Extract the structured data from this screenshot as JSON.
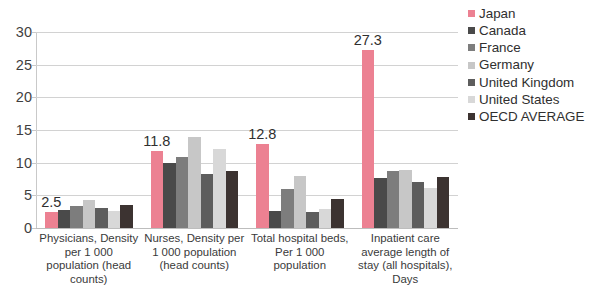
{
  "chart_data": {
    "type": "bar",
    "title": "",
    "subtitle": "",
    "xlabel": "",
    "ylabel": "",
    "ylim": [
      0,
      30
    ],
    "ytick_step": 5,
    "ytick_labels": [
      "30",
      "25",
      "20",
      "15",
      "10",
      "5",
      "0"
    ],
    "ytick_values": [
      30,
      25,
      20,
      15,
      10,
      5,
      0
    ],
    "grid": true,
    "legend_position": "right",
    "categories": [
      "Physicians, Density per 1 000 population (head counts)",
      "Nurses, Density per 1 000 population (head counts)",
      "Total hospital beds, Per 1 000 population",
      "Inpatient care average length of stay (all hospitals), Days"
    ],
    "category_lines": [
      [
        "Physicians, Density",
        "per 1 000",
        "population (head",
        "counts)"
      ],
      [
        "Nurses, Density per",
        "1 000 population",
        "(head counts)"
      ],
      [
        "Total hospital beds,",
        "Per 1 000",
        "population"
      ],
      [
        "Inpatient care",
        "average length of",
        "stay (all hospitals),",
        "Days"
      ]
    ],
    "series": [
      {
        "name": "Japan",
        "color": "#ec8192",
        "values": [
          2.5,
          11.8,
          12.8,
          27.3
        ]
      },
      {
        "name": "Canada",
        "color": "#4a4a4a",
        "values": [
          2.8,
          10.0,
          2.6,
          7.7
        ]
      },
      {
        "name": "France",
        "color": "#7d7d7d",
        "values": [
          3.4,
          10.8,
          5.9,
          8.8
        ]
      },
      {
        "name": "Germany",
        "color": "#c7c7c7",
        "values": [
          4.3,
          14.0,
          8.0,
          8.9
        ]
      },
      {
        "name": "United Kingdom",
        "color": "#5d5d5d",
        "values": [
          3.0,
          8.2,
          2.5,
          7.0
        ]
      },
      {
        "name": "United States",
        "color": "#d8d8d8",
        "values": [
          2.6,
          12.1,
          2.9,
          6.1
        ]
      },
      {
        "name": "OECD AVERAGE",
        "color": "#3c3331",
        "values": [
          3.5,
          8.8,
          4.4,
          7.8
        ]
      }
    ],
    "data_labels": [
      {
        "group": 0,
        "series": "Japan",
        "text": "2.5"
      },
      {
        "group": 1,
        "series": "Japan",
        "text": "11.8"
      },
      {
        "group": 2,
        "series": "Japan",
        "text": "12.8"
      },
      {
        "group": 3,
        "series": "Japan",
        "text": "27.3"
      }
    ]
  },
  "legend": {
    "items": [
      {
        "label": "Japan",
        "color": "#ec8192"
      },
      {
        "label": "Canada",
        "color": "#4a4a4a"
      },
      {
        "label": "France",
        "color": "#7d7d7d"
      },
      {
        "label": "Germany",
        "color": "#c7c7c7"
      },
      {
        "label": "United Kingdom",
        "color": "#5d5d5d"
      },
      {
        "label": "United States",
        "color": "#d8d8d8"
      },
      {
        "label": "OECD AVERAGE",
        "color": "#3c3331"
      }
    ]
  },
  "colors": {
    "background": "#ffffff",
    "gridline": "#d2d2d2",
    "axis": "#c9c9c9",
    "text": "#3a3a3a",
    "accent": "#ec8192"
  }
}
